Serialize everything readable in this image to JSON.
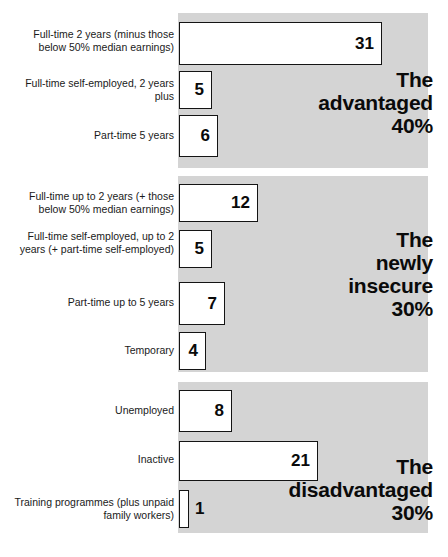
{
  "figure": {
    "background_color": "#ffffff",
    "panel_color": "#d4d4d4",
    "bar_fill": "#ffffff",
    "bar_border": "#141414",
    "text_color": "#1a1a1a"
  },
  "chart_data": {
    "type": "bar",
    "title": "",
    "subtitle": "",
    "xlabel": "",
    "ylabel": "",
    "orientation": "horizontal",
    "grid": false,
    "legend": "none",
    "xlim": [
      0,
      31
    ],
    "value_unit": "percent of workforce",
    "groups": [
      {
        "heading": "The\nadvantaged\n40%",
        "heading_name": "The advantaged",
        "heading_percent": "40%",
        "categories": [
          "Full-time 2 years (minus those below 50% median earnings)",
          "Full-time self-employed, 2 years plus",
          "Part-time 5 years"
        ],
        "values": [
          31,
          5,
          6
        ],
        "value_labels": [
          "31",
          "5",
          "6"
        ]
      },
      {
        "heading": "The\nnewly\ninsecure\n30%",
        "heading_name": "The newly insecure",
        "heading_percent": "30%",
        "categories": [
          "Full-time up to 2 years (+ those below 50% median earnings)",
          "Full-time self-employed, up to 2 years (+ part-time self-employed)",
          "Part-time up to 5 years",
          "Temporary"
        ],
        "values": [
          12,
          5,
          7,
          4
        ],
        "value_labels": [
          "12",
          "5",
          "7",
          "4"
        ]
      },
      {
        "heading": "The\ndisadvantaged\n30%",
        "heading_name": "The disadvantaged",
        "heading_percent": "30%",
        "categories": [
          "Unemployed",
          "Inactive",
          "Training programmes (plus unpaid family workers)"
        ],
        "values": [
          8,
          21,
          1
        ],
        "value_labels": [
          "8",
          "21",
          "1"
        ]
      }
    ]
  },
  "panels": [
    {
      "id": "advantaged",
      "top": 13,
      "height": 155,
      "heading": "The\nadvantaged\n40%",
      "heading_top": 68,
      "rows": [
        {
          "label": "Full-time 2 years (minus those below 50% median earnings)",
          "value": "31",
          "top": 22,
          "height": 43,
          "bar_width": 203,
          "label_top": 28,
          "value_position": "inside"
        },
        {
          "label": "Full-time self-employed, 2 years plus",
          "value": "5",
          "top": 71,
          "height": 38,
          "bar_width": 33,
          "label_top": 77,
          "value_position": "inside"
        },
        {
          "label": "Part-time 5 years",
          "value": "6",
          "top": 115,
          "height": 42,
          "bar_width": 39,
          "label_top": 129,
          "value_position": "inside"
        }
      ]
    },
    {
      "id": "newly-insecure",
      "top": 176,
      "height": 196,
      "heading": "The\nnewly\ninsecure\n30%",
      "heading_top": 228,
      "rows": [
        {
          "label": "Full-time up to 2 years (+ those below 50% median earnings)",
          "value": "12",
          "top": 184,
          "height": 38,
          "bar_width": 79,
          "label_top": 190,
          "value_position": "inside"
        },
        {
          "label": "Full-time self-employed, up to 2 years (+ part-time self-employed)",
          "value": "5",
          "top": 230,
          "height": 38,
          "bar_width": 33,
          "label_top": 230,
          "value_position": "inside"
        },
        {
          "label": "Part-time up to 5 years",
          "value": "7",
          "top": 282,
          "height": 43,
          "bar_width": 46,
          "label_top": 296,
          "value_position": "inside"
        },
        {
          "label": "Temporary",
          "value": "4",
          "top": 332,
          "height": 38,
          "bar_width": 27,
          "label_top": 344,
          "value_position": "inside"
        }
      ]
    },
    {
      "id": "disadvantaged",
      "top": 382,
      "height": 151,
      "heading": "The\ndisadvantaged\n30%",
      "heading_top": 455,
      "rows": [
        {
          "label": "Unemployed",
          "value": "8",
          "top": 390,
          "height": 42,
          "bar_width": 53,
          "label_top": 404,
          "value_position": "inside"
        },
        {
          "label": "Inactive",
          "value": "21",
          "top": 441,
          "height": 40,
          "bar_width": 139,
          "label_top": 453,
          "value_position": "inside"
        },
        {
          "label": "Training programmes (plus unpaid family workers)",
          "value": "1",
          "top": 490,
          "height": 38,
          "bar_width": 10,
          "label_top": 496,
          "value_position": "outside"
        }
      ]
    }
  ]
}
